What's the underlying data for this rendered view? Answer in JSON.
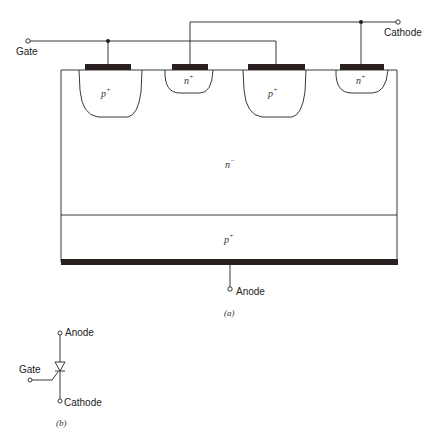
{
  "figure_a": {
    "caption": "(a)",
    "terminals": {
      "gate": "Gate",
      "cathode": "Cathode",
      "anode": "Anode"
    },
    "regions": [
      {
        "id": "p-plus-left",
        "base": "p",
        "sup": "+"
      },
      {
        "id": "n-plus-left",
        "base": "n",
        "sup": "+"
      },
      {
        "id": "p-plus-right",
        "base": "p",
        "sup": "+"
      },
      {
        "id": "n-plus-right",
        "base": "n",
        "sup": "+"
      },
      {
        "id": "n-minus-drift",
        "base": "n",
        "sup": "−"
      },
      {
        "id": "p-plus-substrate",
        "base": "p",
        "sup": "+"
      }
    ]
  },
  "figure_b": {
    "caption": "(b)",
    "terminals": {
      "anode": "Anode",
      "gate": "Gate",
      "cathode": "Cathode"
    }
  },
  "colors": {
    "line": "#222222",
    "metal": "#2a1f1f",
    "background": "#ffffff"
  }
}
